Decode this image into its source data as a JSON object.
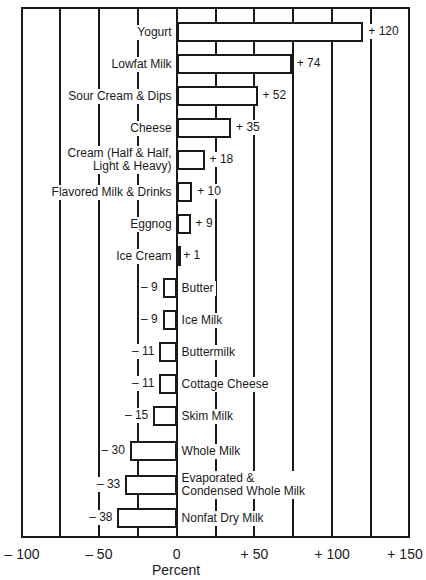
{
  "chart_data": {
    "type": "bar",
    "orientation": "horizontal",
    "title": "",
    "xlabel": "Percent",
    "ylabel": "",
    "xlim": [
      -100,
      150
    ],
    "xticks": [
      -100,
      -50,
      0,
      50,
      100,
      150
    ],
    "xtick_labels": [
      "– 100",
      "– 50",
      "0",
      "+ 50",
      "+ 100",
      "+ 150"
    ],
    "gridlines": [
      -75,
      -50,
      -25,
      0,
      25,
      50,
      75,
      100,
      125
    ],
    "grid": true,
    "legend": null,
    "categories": [
      "Yogurt",
      "Lowfat Milk",
      "Sour Cream & Dips",
      "Cheese",
      "Cream (Half & Half,\nLight & Heavy)",
      "Flavored Milk & Drinks",
      "Eggnog",
      "Ice Cream",
      "Butter",
      "Ice Milk",
      "Buttermilk",
      "Cottage Cheese",
      "Skim Milk",
      "Whole Milk",
      "Evaporated &\nCondensed Whole Milk",
      "Nonfat Dry Milk"
    ],
    "values": [
      120,
      74,
      52,
      35,
      18,
      10,
      9,
      1,
      -9,
      -9,
      -11,
      -11,
      -15,
      -30,
      -33,
      -38
    ],
    "value_labels": [
      "+ 120",
      "+ 74",
      "+ 52",
      "+ 35",
      "+ 18",
      "+ 10",
      "+ 9",
      "+ 1",
      "– 9",
      "– 9",
      "– 11",
      "– 11",
      "– 15",
      "– 30",
      "– 33",
      "– 38"
    ],
    "colors": {
      "bar_fill": "#ffffff",
      "bar_stroke": "#1a1a1a",
      "grid": "#1a1a1a"
    }
  }
}
